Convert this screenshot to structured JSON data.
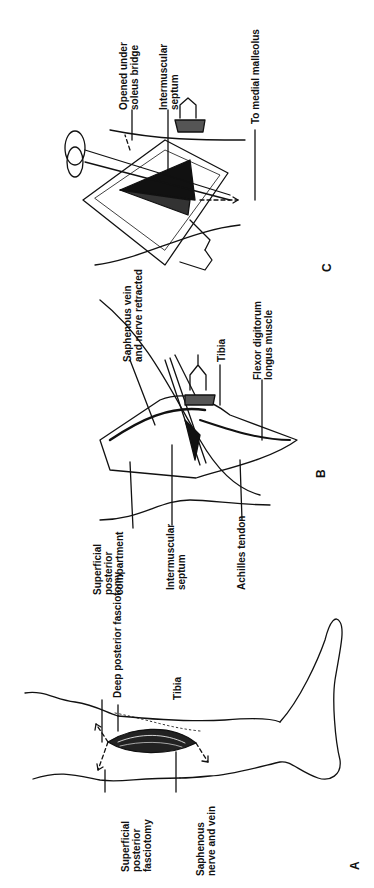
{
  "figure": {
    "orientation": "rotated 90 degrees counter-clockwise",
    "panels": [
      {
        "id": "A",
        "letter": "A",
        "labels": {
          "superficial_posterior_fasciotomy": "Superficial\nposterior\nfasciotomy",
          "deep_posterior_fasciotomy": "Deep posterior fasciotomy",
          "tibia": "Tibia",
          "saphenous_nerve_and_vein": "Saphenous\nnerve and vein"
        }
      },
      {
        "id": "B",
        "letter": "B",
        "labels": {
          "superficial_posterior_compartment": "Superficial\nposterior\ncompartment",
          "intermuscular_septum": "Intermuscular\nseptum",
          "achilles_tendon": "Achilles tendon",
          "saphenous_vein_and_nerve_retracted": "Saphenous vein\nand nerve retracted",
          "tibia": "Tibia",
          "flexor_digitorum_longus_muscle": "Flexor digitorum\nlongus muscle"
        }
      },
      {
        "id": "C",
        "letter": "C",
        "labels": {
          "opened_under_soleus_bridge": "Opened under\nsoleus bridge",
          "intermuscular_septum": "Intermuscular\nseptum",
          "to_medial_malleolus": "To medial malleolus"
        }
      }
    ]
  }
}
